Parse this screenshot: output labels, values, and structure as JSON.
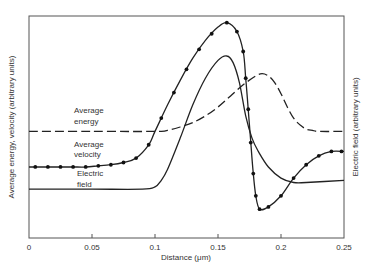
{
  "chart_data": {
    "type": "line",
    "title": "",
    "xlabel": "Distance (μm)",
    "ylabel": "Average energy, velocity (arbitrary units)",
    "y2label": "Electric field (arbitrary units)",
    "xlim": [
      0,
      0.25
    ],
    "ylim": [
      0,
      1
    ],
    "grid": false,
    "x_ticks": [
      0,
      0.05,
      0.1,
      0.15,
      0.2,
      0.25
    ],
    "x_tick_labels": [
      "0",
      "0.05",
      "0.1",
      "0.15",
      "0.2",
      "0.25"
    ],
    "series": [
      {
        "name": "Average energy",
        "style": "dashed",
        "markers": false,
        "x": [
          0,
          0.05,
          0.1,
          0.11,
          0.12,
          0.13,
          0.14,
          0.15,
          0.16,
          0.17,
          0.18,
          0.185,
          0.19,
          0.195,
          0.2,
          0.205,
          0.21,
          0.215,
          0.22,
          0.225,
          0.23,
          0.25
        ],
        "y": [
          0.48,
          0.48,
          0.48,
          0.485,
          0.5,
          0.52,
          0.55,
          0.59,
          0.64,
          0.69,
          0.73,
          0.74,
          0.73,
          0.7,
          0.65,
          0.59,
          0.54,
          0.51,
          0.49,
          0.485,
          0.48,
          0.48
        ]
      },
      {
        "name": "Average velocity",
        "style": "solid",
        "markers": true,
        "x": [
          0,
          0.005,
          0.015,
          0.025,
          0.035,
          0.045,
          0.055,
          0.065,
          0.075,
          0.085,
          0.095,
          0.1,
          0.11,
          0.12,
          0.13,
          0.14,
          0.15,
          0.157,
          0.165,
          0.17,
          0.172,
          0.174,
          0.176,
          0.178,
          0.18,
          0.183,
          0.19,
          0.2,
          0.21,
          0.22,
          0.23,
          0.24,
          0.25
        ],
        "y": [
          0.32,
          0.32,
          0.32,
          0.32,
          0.32,
          0.32,
          0.325,
          0.33,
          0.34,
          0.36,
          0.42,
          0.48,
          0.6,
          0.71,
          0.81,
          0.89,
          0.95,
          0.97,
          0.93,
          0.84,
          0.72,
          0.58,
          0.43,
          0.29,
          0.19,
          0.13,
          0.14,
          0.19,
          0.27,
          0.33,
          0.37,
          0.39,
          0.39
        ],
        "marker_x": [
          0.005,
          0.015,
          0.025,
          0.035,
          0.045,
          0.055,
          0.065,
          0.075,
          0.085,
          0.095,
          0.105,
          0.115,
          0.125,
          0.135,
          0.145,
          0.157,
          0.165,
          0.17,
          0.172,
          0.174,
          0.176,
          0.178,
          0.18,
          0.183,
          0.19,
          0.2,
          0.21,
          0.22,
          0.23,
          0.24,
          0.248
        ]
      },
      {
        "name": "Electric field",
        "style": "solid",
        "markers": false,
        "x": [
          0,
          0.05,
          0.09,
          0.1,
          0.105,
          0.11,
          0.12,
          0.13,
          0.14,
          0.15,
          0.157,
          0.162,
          0.167,
          0.172,
          0.177,
          0.182,
          0.19,
          0.2,
          0.21,
          0.22,
          0.25
        ],
        "y": [
          0.22,
          0.22,
          0.22,
          0.23,
          0.26,
          0.31,
          0.45,
          0.6,
          0.72,
          0.8,
          0.82,
          0.79,
          0.7,
          0.55,
          0.45,
          0.39,
          0.32,
          0.27,
          0.25,
          0.25,
          0.26
        ]
      }
    ],
    "annotations": [
      {
        "text_line1": "Average",
        "text_line2": "energy",
        "series": "Average energy"
      },
      {
        "text_line1": "Average",
        "text_line2": "velocity",
        "series": "Average velocity"
      },
      {
        "text_line1": "Electric",
        "text_line2": "field",
        "series": "Electric field"
      }
    ]
  }
}
